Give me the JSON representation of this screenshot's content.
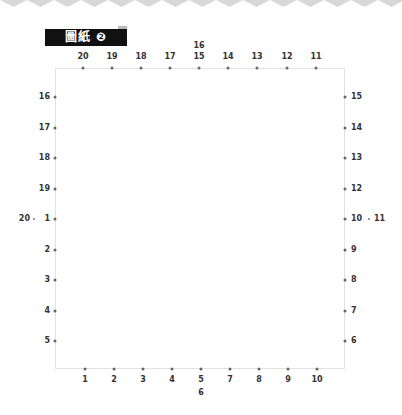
{
  "title": {
    "text": "圖紙",
    "number_glyph": "❷"
  },
  "colors": {
    "badge_bg": "#111111",
    "badge_text": "#ffffff",
    "frame_border": "#e2e2e2",
    "dot": "#666666",
    "zigzag": "#d8d8d8"
  },
  "top_row": {
    "labels": [
      "20",
      "19",
      "18",
      "17",
      "15",
      "14",
      "13",
      "12",
      "11"
    ],
    "extra_above_label": "16"
  },
  "bottom_row": {
    "labels": [
      "1",
      "2",
      "3",
      "4",
      "5",
      "7",
      "8",
      "9",
      "10"
    ],
    "extra_below_label": "6"
  },
  "left_column": {
    "labels": [
      "16",
      "17",
      "18",
      "19",
      "1",
      "2",
      "3",
      "4",
      "5"
    ],
    "extra_left_label": "20"
  },
  "right_column": {
    "labels": [
      "15",
      "14",
      "13",
      "12",
      "10",
      "9",
      "8",
      "7",
      "6"
    ],
    "extra_right_label": "11"
  }
}
